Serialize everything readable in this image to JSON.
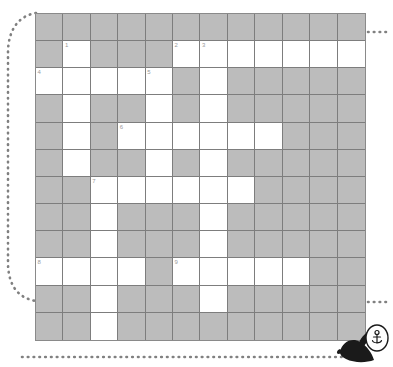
{
  "puzzle": {
    "title": "Crossword Grid",
    "columns": 12,
    "rows": 12,
    "block_color": "#bcbcbc",
    "open_color": "#ffffff",
    "grid_line_color": "#7d7d7d",
    "number_color": "#9a9a9a",
    "cells": [
      [
        {
          "type": "block",
          "number": ""
        },
        {
          "type": "block",
          "number": ""
        },
        {
          "type": "block",
          "number": ""
        },
        {
          "type": "block",
          "number": ""
        },
        {
          "type": "block",
          "number": ""
        },
        {
          "type": "block",
          "number": ""
        },
        {
          "type": "block",
          "number": ""
        },
        {
          "type": "block",
          "number": ""
        },
        {
          "type": "block",
          "number": ""
        },
        {
          "type": "block",
          "number": ""
        },
        {
          "type": "block",
          "number": ""
        },
        {
          "type": "block",
          "number": ""
        }
      ],
      [
        {
          "type": "block",
          "number": ""
        },
        {
          "type": "open",
          "number": "1"
        },
        {
          "type": "block",
          "number": ""
        },
        {
          "type": "block",
          "number": ""
        },
        {
          "type": "block",
          "number": ""
        },
        {
          "type": "open",
          "number": "2"
        },
        {
          "type": "open",
          "number": "3"
        },
        {
          "type": "open",
          "number": ""
        },
        {
          "type": "open",
          "number": ""
        },
        {
          "type": "open",
          "number": ""
        },
        {
          "type": "open",
          "number": ""
        },
        {
          "type": "open",
          "number": ""
        }
      ],
      [
        {
          "type": "open",
          "number": "4"
        },
        {
          "type": "open",
          "number": ""
        },
        {
          "type": "open",
          "number": ""
        },
        {
          "type": "open",
          "number": ""
        },
        {
          "type": "open",
          "number": "5"
        },
        {
          "type": "block",
          "number": ""
        },
        {
          "type": "open",
          "number": ""
        },
        {
          "type": "block",
          "number": ""
        },
        {
          "type": "block",
          "number": ""
        },
        {
          "type": "block",
          "number": ""
        },
        {
          "type": "block",
          "number": ""
        },
        {
          "type": "block",
          "number": ""
        }
      ],
      [
        {
          "type": "block",
          "number": ""
        },
        {
          "type": "open",
          "number": ""
        },
        {
          "type": "block",
          "number": ""
        },
        {
          "type": "block",
          "number": ""
        },
        {
          "type": "open",
          "number": ""
        },
        {
          "type": "block",
          "number": ""
        },
        {
          "type": "open",
          "number": ""
        },
        {
          "type": "block",
          "number": ""
        },
        {
          "type": "block",
          "number": ""
        },
        {
          "type": "block",
          "number": ""
        },
        {
          "type": "block",
          "number": ""
        },
        {
          "type": "block",
          "number": ""
        }
      ],
      [
        {
          "type": "block",
          "number": ""
        },
        {
          "type": "open",
          "number": ""
        },
        {
          "type": "block",
          "number": ""
        },
        {
          "type": "open",
          "number": "6"
        },
        {
          "type": "open",
          "number": ""
        },
        {
          "type": "open",
          "number": ""
        },
        {
          "type": "open",
          "number": ""
        },
        {
          "type": "open",
          "number": ""
        },
        {
          "type": "open",
          "number": ""
        },
        {
          "type": "block",
          "number": ""
        },
        {
          "type": "block",
          "number": ""
        },
        {
          "type": "block",
          "number": ""
        }
      ],
      [
        {
          "type": "block",
          "number": ""
        },
        {
          "type": "open",
          "number": ""
        },
        {
          "type": "block",
          "number": ""
        },
        {
          "type": "block",
          "number": ""
        },
        {
          "type": "open",
          "number": ""
        },
        {
          "type": "block",
          "number": ""
        },
        {
          "type": "open",
          "number": ""
        },
        {
          "type": "block",
          "number": ""
        },
        {
          "type": "block",
          "number": ""
        },
        {
          "type": "block",
          "number": ""
        },
        {
          "type": "block",
          "number": ""
        },
        {
          "type": "block",
          "number": ""
        }
      ],
      [
        {
          "type": "block",
          "number": ""
        },
        {
          "type": "block",
          "number": ""
        },
        {
          "type": "open",
          "number": "7"
        },
        {
          "type": "open",
          "number": ""
        },
        {
          "type": "open",
          "number": ""
        },
        {
          "type": "open",
          "number": ""
        },
        {
          "type": "open",
          "number": ""
        },
        {
          "type": "open",
          "number": ""
        },
        {
          "type": "block",
          "number": ""
        },
        {
          "type": "block",
          "number": ""
        },
        {
          "type": "block",
          "number": ""
        },
        {
          "type": "block",
          "number": ""
        }
      ],
      [
        {
          "type": "block",
          "number": ""
        },
        {
          "type": "block",
          "number": ""
        },
        {
          "type": "open",
          "number": ""
        },
        {
          "type": "block",
          "number": ""
        },
        {
          "type": "block",
          "number": ""
        },
        {
          "type": "block",
          "number": ""
        },
        {
          "type": "open",
          "number": ""
        },
        {
          "type": "block",
          "number": ""
        },
        {
          "type": "block",
          "number": ""
        },
        {
          "type": "block",
          "number": ""
        },
        {
          "type": "block",
          "number": ""
        },
        {
          "type": "block",
          "number": ""
        }
      ],
      [
        {
          "type": "block",
          "number": ""
        },
        {
          "type": "block",
          "number": ""
        },
        {
          "type": "open",
          "number": ""
        },
        {
          "type": "block",
          "number": ""
        },
        {
          "type": "block",
          "number": ""
        },
        {
          "type": "block",
          "number": ""
        },
        {
          "type": "open",
          "number": ""
        },
        {
          "type": "block",
          "number": ""
        },
        {
          "type": "block",
          "number": ""
        },
        {
          "type": "block",
          "number": ""
        },
        {
          "type": "block",
          "number": ""
        },
        {
          "type": "block",
          "number": ""
        }
      ],
      [
        {
          "type": "open",
          "number": "8"
        },
        {
          "type": "open",
          "number": ""
        },
        {
          "type": "open",
          "number": ""
        },
        {
          "type": "open",
          "number": ""
        },
        {
          "type": "block",
          "number": ""
        },
        {
          "type": "open",
          "number": "9"
        },
        {
          "type": "open",
          "number": ""
        },
        {
          "type": "open",
          "number": ""
        },
        {
          "type": "open",
          "number": ""
        },
        {
          "type": "open",
          "number": ""
        },
        {
          "type": "block",
          "number": ""
        },
        {
          "type": "block",
          "number": ""
        }
      ],
      [
        {
          "type": "block",
          "number": ""
        },
        {
          "type": "block",
          "number": ""
        },
        {
          "type": "open",
          "number": ""
        },
        {
          "type": "block",
          "number": ""
        },
        {
          "type": "block",
          "number": ""
        },
        {
          "type": "block",
          "number": ""
        },
        {
          "type": "open",
          "number": ""
        },
        {
          "type": "block",
          "number": ""
        },
        {
          "type": "block",
          "number": ""
        },
        {
          "type": "block",
          "number": ""
        },
        {
          "type": "block",
          "number": ""
        },
        {
          "type": "block",
          "number": ""
        }
      ],
      [
        {
          "type": "block",
          "number": ""
        },
        {
          "type": "block",
          "number": ""
        },
        {
          "type": "open",
          "number": ""
        },
        {
          "type": "block",
          "number": ""
        },
        {
          "type": "block",
          "number": ""
        },
        {
          "type": "block",
          "number": ""
        },
        {
          "type": "block",
          "number": ""
        },
        {
          "type": "block",
          "number": ""
        },
        {
          "type": "block",
          "number": ""
        },
        {
          "type": "block",
          "number": ""
        },
        {
          "type": "block",
          "number": ""
        },
        {
          "type": "block",
          "number": ""
        }
      ]
    ]
  },
  "decor": {
    "dotted_path_color": "#808080",
    "bird_body_color": "#1a1a1a",
    "bird_head_color": "#ffffff",
    "bird_outline_color": "#1a1a1a",
    "bird_icon_name": "anchor-icon"
  }
}
